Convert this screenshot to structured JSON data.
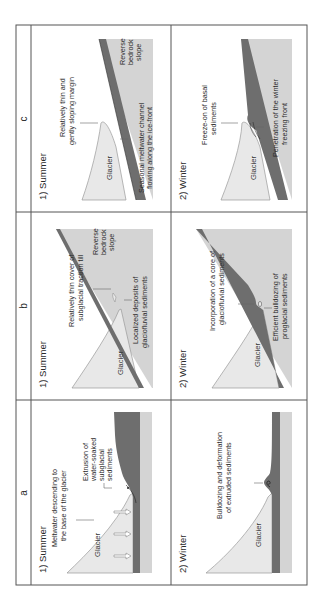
{
  "figure": {
    "orientation": "rotated-90-ccw",
    "columns": [
      {
        "id": "a",
        "label": "a"
      },
      {
        "id": "b",
        "label": "b"
      },
      {
        "id": "c",
        "label": "c"
      }
    ],
    "panels": {
      "a_summer": {
        "season": "1) Summer",
        "glacier": "Glacier",
        "annotations": [
          "Meltwater descending to",
          "the base of the glacier",
          "Extrusion of",
          "water-soaked",
          "subglacial",
          "sediments"
        ]
      },
      "a_winter": {
        "season": "2) Winter",
        "glacier": "Glacier",
        "annotations": [
          "Bulldozing and deformation",
          "of extruded sediments"
        ]
      },
      "b_summer": {
        "season": "1) Summer",
        "glacier": "Glacier",
        "annotations": [
          "Relatively thin cover of",
          "subglacial traction till",
          "Reverse",
          "bedrock",
          "slope",
          "Localized deposits of",
          "glaciofluvial sediments"
        ]
      },
      "b_winter": {
        "season": "2) Winter",
        "glacier": "Glacier",
        "annotations": [
          "Incorporation of a core of",
          "glaciofluvial sediments",
          "Efficient bulldozing of",
          "proglacial sediments"
        ]
      },
      "c_summer": {
        "season": "1) Summer",
        "glacier": "Glacier",
        "annotations": [
          "Relatively thin and",
          "gently sloping margin",
          "Reverse",
          "bedrock",
          "slope",
          "Seasonal meltwater channel",
          "flowing along the ice-front"
        ]
      },
      "c_winter": {
        "season": "2) Winter",
        "glacier": "Glacier",
        "annotations": [
          "Freeze-on of basal",
          "sediments",
          "Penetration of the winter",
          "freezing front"
        ]
      }
    },
    "colors": {
      "border": "#555555",
      "glacier": "#e6e6e6",
      "glacier_edge": "#9a9a9a",
      "sediment": "#6e6e6e",
      "ground": "#c8c8c8",
      "leader": "#666666"
    }
  }
}
